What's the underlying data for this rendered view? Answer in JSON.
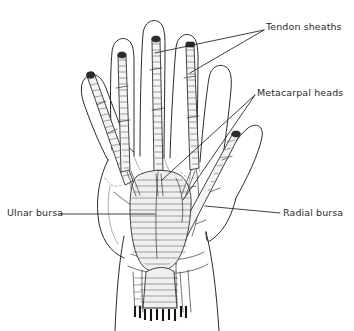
{
  "figure": {
    "view": "palmar (anterior) view of the right hand",
    "background_color": "#ffffff",
    "ink_color": "#2b2b2b",
    "label_color": "#2a2a2a"
  },
  "labels": [
    {
      "id": "tendon-sheaths",
      "text": "Tendon sheaths",
      "position": "top-right",
      "leader_count": 2,
      "points_to": "digital flexor tendon sheaths of the middle and ring fingers"
    },
    {
      "id": "metacarpal-heads",
      "text": "Metacarpal heads",
      "position": "upper-right",
      "leader_count": 2,
      "points_to": "heads of the metacarpal bones in the distal palm"
    },
    {
      "id": "ulnar-bursa",
      "text": "Ulnar bursa",
      "position": "left",
      "leader_count": 1,
      "points_to": "common flexor sheath in the central palm"
    },
    {
      "id": "radial-bursa",
      "text": "Radial bursa",
      "position": "right",
      "leader_count": 1,
      "points_to": "flexor pollicis longus sheath along the thumb"
    }
  ],
  "structures": {
    "digits": [
      {
        "name": "little-finger",
        "sheath": "hatched tendon sheath, angled toward ulnar palm"
      },
      {
        "name": "ring-finger",
        "sheath": "hatched tendon sheath with dark proximal cap"
      },
      {
        "name": "middle-finger",
        "sheath": "hatched tendon sheath with dark proximal cap"
      },
      {
        "name": "index-finger",
        "sheath": "hatched tendon sheath with dark proximal cap"
      },
      {
        "name": "thumb",
        "sheath": "radial bursa sheath running to the wrist"
      }
    ],
    "palm": "broad palm outline with thenar and hypothenar eminences",
    "wrist": "forearm cut transversely at the distal wrist with hatched cut surface and dark tick marks"
  }
}
